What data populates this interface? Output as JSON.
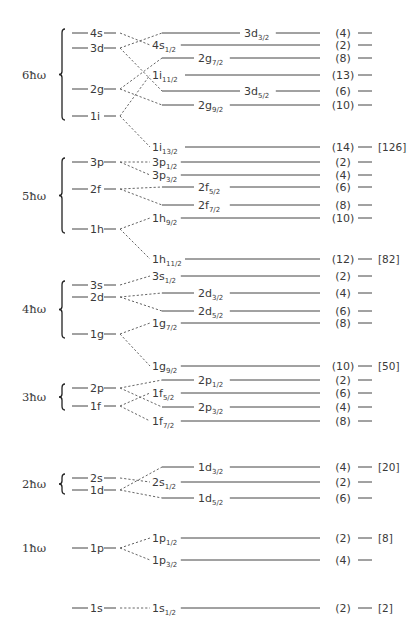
{
  "shells": [
    {
      "label": "6ħω",
      "y": 75,
      "brace": [
        33,
        116
      ],
      "oscillator_levels": [
        {
          "name": "4s",
          "y": 33
        },
        {
          "name": "3d",
          "y": 48
        },
        {
          "name": "2g",
          "y": 89
        },
        {
          "name": "1i",
          "y": 116
        }
      ]
    },
    {
      "label": "5ħω",
      "y": 196,
      "brace": [
        162,
        229
      ],
      "oscillator_levels": [
        {
          "name": "3p",
          "y": 162
        },
        {
          "name": "2f",
          "y": 189
        },
        {
          "name": "1h",
          "y": 229
        }
      ]
    },
    {
      "label": "4ħω",
      "y": 309,
      "brace": [
        285,
        334
      ],
      "oscillator_levels": [
        {
          "name": "3s",
          "y": 285
        },
        {
          "name": "2d",
          "y": 297
        },
        {
          "name": "1g",
          "y": 334
        }
      ]
    },
    {
      "label": "3ħω",
      "y": 397,
      "brace": [
        388,
        406
      ],
      "oscillator_levels": [
        {
          "name": "2p",
          "y": 388
        },
        {
          "name": "1f",
          "y": 406
        }
      ]
    },
    {
      "label": "2ħω",
      "y": 484,
      "brace": [
        478,
        490
      ],
      "oscillator_levels": [
        {
          "name": "2s",
          "y": 478
        },
        {
          "name": "1d",
          "y": 490
        }
      ]
    },
    {
      "label": "1ħω",
      "y": 548,
      "brace": null,
      "oscillator_levels": [
        {
          "name": "1p",
          "y": 548
        }
      ]
    },
    {
      "label": "",
      "y": 608,
      "brace": null,
      "oscillator_levels": [
        {
          "name": "1s",
          "y": 608
        }
      ]
    }
  ],
  "spin_orbit_levels": [
    {
      "nl": "3d",
      "j": "3/2",
      "y": 33,
      "from": "3d",
      "from_y": 48,
      "count": "(4)",
      "magic": "",
      "label_pos": "inline"
    },
    {
      "nl": "4s",
      "j": "1/2",
      "y": 45,
      "from": "4s",
      "from_y": 33,
      "count": "(2)",
      "magic": "",
      "label_pos": "start"
    },
    {
      "nl": "2g",
      "j": "7/2",
      "y": 58,
      "from": "2g",
      "from_y": 89,
      "count": "(8)",
      "magic": "",
      "label_pos": "inline-left"
    },
    {
      "nl": "1i",
      "j": "11/2",
      "y": 75,
      "from": "1i",
      "from_y": 116,
      "count": "(13)",
      "magic": "",
      "label_pos": "start"
    },
    {
      "nl": "3d",
      "j": "5/2",
      "y": 91,
      "from": "3d",
      "from_y": 48,
      "count": "(6)",
      "magic": "",
      "label_pos": "inline"
    },
    {
      "nl": "2g",
      "j": "9/2",
      "y": 105,
      "from": "2g",
      "from_y": 89,
      "count": "(10)",
      "magic": "",
      "label_pos": "inline-left"
    },
    {
      "nl": "1i",
      "j": "13/2",
      "y": 147,
      "from": "1i",
      "from_y": 116,
      "count": "(14)",
      "magic": "[126]",
      "label_pos": "start"
    },
    {
      "nl": "3p",
      "j": "1/2",
      "y": 162,
      "from": "3p",
      "from_y": 162,
      "count": "(2)",
      "magic": "",
      "label_pos": "start"
    },
    {
      "nl": "3p",
      "j": "3/2",
      "y": 175,
      "from": "3p",
      "from_y": 162,
      "count": "(4)",
      "magic": "",
      "label_pos": "start"
    },
    {
      "nl": "2f",
      "j": "5/2",
      "y": 187,
      "from": "2f",
      "from_y": 189,
      "count": "(6)",
      "magic": "",
      "label_pos": "inline-left"
    },
    {
      "nl": "2f",
      "j": "7/2",
      "y": 205,
      "from": "2f",
      "from_y": 189,
      "count": "(8)",
      "magic": "",
      "label_pos": "inline-left"
    },
    {
      "nl": "1h",
      "j": "9/2",
      "y": 218,
      "from": "1h",
      "from_y": 229,
      "count": "(10)",
      "magic": "",
      "label_pos": "start"
    },
    {
      "nl": "1h",
      "j": "11/2",
      "y": 259,
      "from": "1h",
      "from_y": 229,
      "count": "(12)",
      "magic": "[82]",
      "label_pos": "start"
    },
    {
      "nl": "3s",
      "j": "1/2",
      "y": 276,
      "from": "3s",
      "from_y": 285,
      "count": "(2)",
      "magic": "",
      "label_pos": "start"
    },
    {
      "nl": "2d",
      "j": "3/2",
      "y": 293,
      "from": "2d",
      "from_y": 297,
      "count": "(4)",
      "magic": "",
      "label_pos": "inline-left"
    },
    {
      "nl": "2d",
      "j": "5/2",
      "y": 311,
      "from": "2d",
      "from_y": 297,
      "count": "(6)",
      "magic": "",
      "label_pos": "inline-left"
    },
    {
      "nl": "1g",
      "j": "7/2",
      "y": 323,
      "from": "1g",
      "from_y": 334,
      "count": "(8)",
      "magic": "",
      "label_pos": "start"
    },
    {
      "nl": "1g",
      "j": "9/2",
      "y": 366,
      "from": "1g",
      "from_y": 334,
      "count": "(10)",
      "magic": "[50]",
      "label_pos": "start"
    },
    {
      "nl": "2p",
      "j": "1/2",
      "y": 380,
      "from": "2p",
      "from_y": 388,
      "count": "(2)",
      "magic": "",
      "label_pos": "inline-left"
    },
    {
      "nl": "1f",
      "j": "5/2",
      "y": 393,
      "from": "1f",
      "from_y": 406,
      "count": "(6)",
      "magic": "",
      "label_pos": "start"
    },
    {
      "nl": "2p",
      "j": "3/2",
      "y": 407,
      "from": "2p",
      "from_y": 388,
      "count": "(4)",
      "magic": "",
      "label_pos": "inline-left"
    },
    {
      "nl": "1f",
      "j": "7/2",
      "y": 421,
      "from": "1f",
      "from_y": 406,
      "count": "(8)",
      "magic": "",
      "label_pos": "start"
    },
    {
      "nl": "1d",
      "j": "3/2",
      "y": 467,
      "from": "1d",
      "from_y": 490,
      "count": "(4)",
      "magic": "[20]",
      "label_pos": "inline-left"
    },
    {
      "nl": "2s",
      "j": "1/2",
      "y": 482,
      "from": "2s",
      "from_y": 478,
      "count": "(2)",
      "magic": "",
      "label_pos": "start"
    },
    {
      "nl": "1d",
      "j": "5/2",
      "y": 498,
      "from": "1d",
      "from_y": 490,
      "count": "(6)",
      "magic": "",
      "label_pos": "inline-left"
    },
    {
      "nl": "1p",
      "j": "1/2",
      "y": 538,
      "from": "1p",
      "from_y": 548,
      "count": "(2)",
      "magic": "[8]",
      "label_pos": "start"
    },
    {
      "nl": "1p",
      "j": "3/2",
      "y": 560,
      "from": "1p",
      "from_y": 548,
      "count": "(4)",
      "magic": "",
      "label_pos": "start"
    },
    {
      "nl": "1s",
      "j": "1/2",
      "y": 608,
      "from": "1s",
      "from_y": 608,
      "count": "(2)",
      "magic": "[2]",
      "label_pos": "start"
    }
  ],
  "magic_numbers": [
    "[2]",
    "[8]",
    "[20]",
    "[50]",
    "[82]",
    "[126]"
  ]
}
